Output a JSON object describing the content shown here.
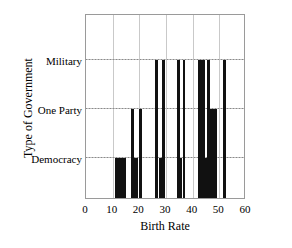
{
  "chart_data": {
    "type": "bar",
    "title": "",
    "xlabel": "Birth Rate",
    "ylabel": "Type of Government",
    "xlim": [
      0,
      60
    ],
    "ylim": [
      0,
      3
    ],
    "grid": true,
    "legend": "none",
    "xticks": [
      "0",
      "10",
      "20",
      "30",
      "40",
      "50",
      "60"
    ],
    "xtick_values": [
      0,
      10,
      20,
      30,
      40,
      50,
      60
    ],
    "ycategories": [
      "Democracy",
      "One Party",
      "Military"
    ],
    "ycategory_levels": [
      1,
      2,
      3
    ],
    "bars": [
      {
        "x_start": 11.0,
        "x_end": 15.0,
        "level": "Democracy",
        "value": 1
      },
      {
        "x_start": 17.0,
        "x_end": 18.0,
        "level": "One Party",
        "value": 2
      },
      {
        "x_start": 18.0,
        "x_end": 19.5,
        "level": "Democracy",
        "value": 1
      },
      {
        "x_start": 20.0,
        "x_end": 21.0,
        "level": "One Party",
        "value": 2
      },
      {
        "x_start": 26.0,
        "x_end": 27.2,
        "level": "Military",
        "value": 3
      },
      {
        "x_start": 27.2,
        "x_end": 28.5,
        "level": "Democracy",
        "value": 1
      },
      {
        "x_start": 28.5,
        "x_end": 29.7,
        "level": "Military",
        "value": 3
      },
      {
        "x_start": 34.0,
        "x_end": 35.2,
        "level": "Military",
        "value": 3
      },
      {
        "x_start": 35.2,
        "x_end": 36.0,
        "level": "Democracy",
        "value": 1
      },
      {
        "x_start": 36.3,
        "x_end": 37.3,
        "level": "Military",
        "value": 3
      },
      {
        "x_start": 42.0,
        "x_end": 44.6,
        "level": "Military",
        "value": 3
      },
      {
        "x_start": 44.6,
        "x_end": 45.4,
        "level": "Democracy",
        "value": 1
      },
      {
        "x_start": 45.4,
        "x_end": 46.4,
        "level": "Military",
        "value": 3
      },
      {
        "x_start": 46.4,
        "x_end": 49.0,
        "level": "One Party",
        "value": 2
      },
      {
        "x_start": 51.4,
        "x_end": 52.6,
        "level": "Military",
        "value": 3
      }
    ],
    "colors": {
      "bar": "#111111",
      "frame": "#9a9a9a",
      "grid": "#c9c9c9",
      "background": "#ffffff",
      "text": "#000000"
    }
  }
}
